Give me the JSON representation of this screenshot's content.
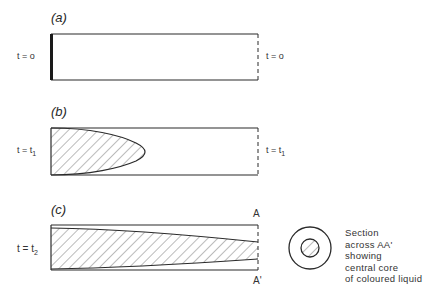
{
  "figure": {
    "panels": [
      {
        "id": "a",
        "label": "(a)",
        "time_left": "t = o",
        "time_right": "t = o",
        "state": "coloured liquid at tube inlet only"
      },
      {
        "id": "b",
        "label": "(b)",
        "time_left": "t = t",
        "time_left_sub": "1",
        "time_right": "t = t",
        "time_right_sub": "1",
        "state": "parabolic front of coloured liquid"
      },
      {
        "id": "c",
        "label": "(c)",
        "time_left": "t = t",
        "time_left_sub": "2",
        "state": "coloured core extends along tube length",
        "section_top": "A",
        "section_bottom": "A'"
      }
    ],
    "section_view": {
      "caption_lines": [
        "Section",
        "across AA'",
        "showing",
        "central core",
        "of coloured liquid"
      ]
    },
    "colors": {
      "line": "#2a2a2a",
      "hatch": "#555555",
      "background": "#ffffff"
    }
  }
}
